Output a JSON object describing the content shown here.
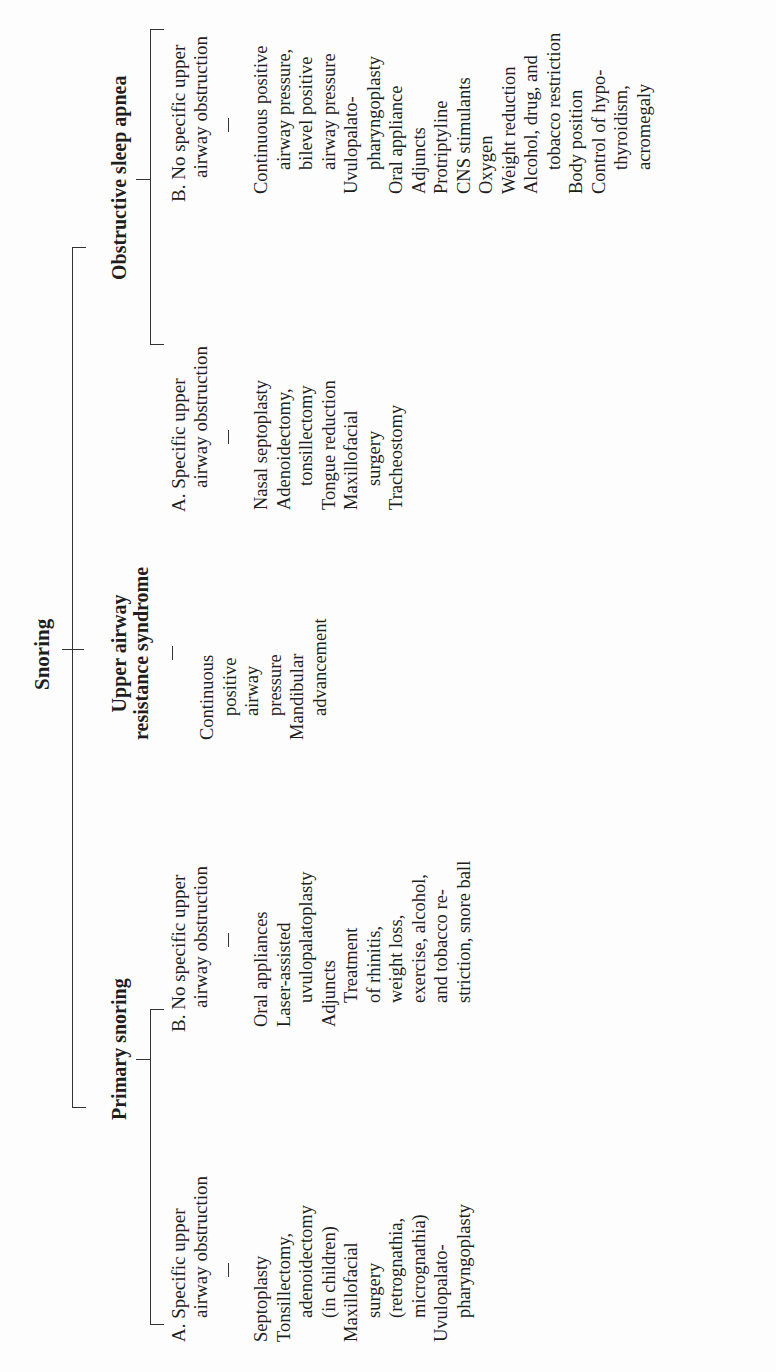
{
  "diagram": {
    "root": "Snoring",
    "branches": [
      {
        "label": "Primary snoring",
        "subgroups": [
          {
            "label_lines": [
              "A. Specific upper",
              "airway obstruction"
            ],
            "items": [
              {
                "text": "Septoplasty",
                "indent": false
              },
              {
                "text": "Tonsillectomy,",
                "indent": false
              },
              {
                "text": "adenoidectomy",
                "indent": true
              },
              {
                "text": "(in children)",
                "indent": true
              },
              {
                "text": "Maxillofacial",
                "indent": false
              },
              {
                "text": "surgery",
                "indent": true
              },
              {
                "text": "(retrognathia,",
                "indent": true
              },
              {
                "text": "micrognathia)",
                "indent": true
              },
              {
                "text": "Uvulopalato-",
                "indent": false
              },
              {
                "text": "pharyngoplasty",
                "indent": true
              }
            ]
          },
          {
            "label_lines": [
              "B. No specific upper",
              "airway obstruction"
            ],
            "items": [
              {
                "text": "Oral appliances",
                "indent": false
              },
              {
                "text": "Laser-assisted",
                "indent": false
              },
              {
                "text": "uvulopalatoplasty",
                "indent": true
              },
              {
                "text": "Adjuncts",
                "indent": false
              },
              {
                "text": "Treatment",
                "indent": true
              },
              {
                "text": "of rhinitis,",
                "indent": true
              },
              {
                "text": "weight loss,",
                "indent": true
              },
              {
                "text": "exercise, alcohol,",
                "indent": true
              },
              {
                "text": "and tobacco re-",
                "indent": true
              },
              {
                "text": "striction, snore ball",
                "indent": true
              }
            ]
          }
        ]
      },
      {
        "label_lines": [
          "Upper airway",
          "resistance syndrome"
        ],
        "items": [
          {
            "text": "Continuous",
            "indent": false
          },
          {
            "text": "positive",
            "indent": true
          },
          {
            "text": "airway",
            "indent": true
          },
          {
            "text": "pressure",
            "indent": true
          },
          {
            "text": "Mandibular",
            "indent": false
          },
          {
            "text": "advancement",
            "indent": true
          }
        ]
      },
      {
        "label": "Obstructive sleep apnea",
        "subgroups": [
          {
            "label_lines": [
              "A. Specific upper",
              "airway obstruction"
            ],
            "items": [
              {
                "text": "Nasal septoplasty",
                "indent": false
              },
              {
                "text": "Adenoidectomy,",
                "indent": false
              },
              {
                "text": "tonsillectomy",
                "indent": true
              },
              {
                "text": "Tongue reduction",
                "indent": false
              },
              {
                "text": "Maxillofacial",
                "indent": false
              },
              {
                "text": "surgery",
                "indent": true
              },
              {
                "text": "Tracheostomy",
                "indent": false
              }
            ]
          },
          {
            "label_lines": [
              "B. No specific upper",
              "airway obstruction"
            ],
            "items": [
              {
                "text": "Continuous positive",
                "indent": false
              },
              {
                "text": "airway pressure,",
                "indent": true
              },
              {
                "text": "bilevel positive",
                "indent": true
              },
              {
                "text": "airway pressure",
                "indent": true
              },
              {
                "text": "Uvulopalato-",
                "indent": false
              },
              {
                "text": "pharyngoplasty",
                "indent": true
              },
              {
                "text": "Oral appliance",
                "indent": false
              },
              {
                "text": "Adjuncts",
                "indent": false
              },
              {
                "text": "Protriptyline",
                "indent": false
              },
              {
                "text": "CNS stimulants",
                "indent": false
              },
              {
                "text": "Oxygen",
                "indent": false
              },
              {
                "text": "Weight reduction",
                "indent": false
              },
              {
                "text": "Alcohol, drug, and",
                "indent": false
              },
              {
                "text": "tobacco restriction",
                "indent": true
              },
              {
                "text": "Body position",
                "indent": false
              },
              {
                "text": "Control of hypo-",
                "indent": false
              },
              {
                "text": "thyroidism,",
                "indent": true
              },
              {
                "text": "acromegaly",
                "indent": true
              }
            ]
          }
        ]
      }
    ]
  },
  "colors": {
    "ink": "#1e1e1e",
    "lines": "#333333",
    "paper": "#fdfdfd"
  }
}
